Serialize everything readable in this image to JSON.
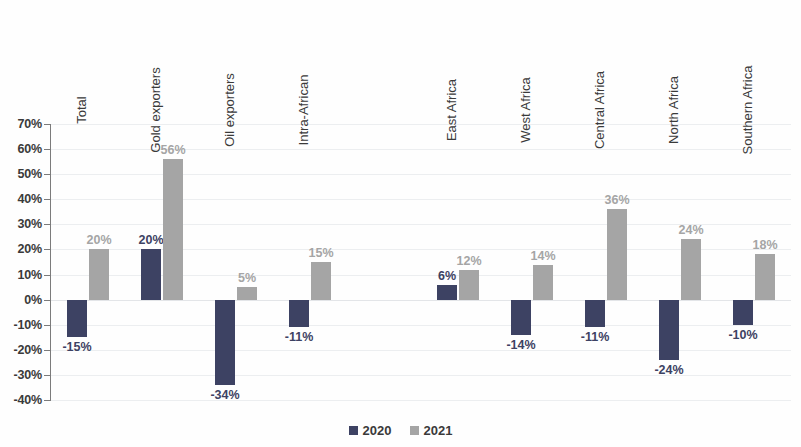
{
  "chart_data": {
    "type": "bar",
    "title": "",
    "subtitle": "",
    "xlabel": "",
    "ylabel": "",
    "ylim": [
      -40,
      70
    ],
    "ytick_labels": [
      "70%",
      "60%",
      "50%",
      "40%",
      "30%",
      "20%",
      "10%",
      "0%",
      "-10%",
      "-20%",
      "-30%",
      "-40%"
    ],
    "ytick_values": [
      70,
      60,
      50,
      40,
      30,
      20,
      10,
      0,
      -10,
      -20,
      -30,
      -40
    ],
    "grid": true,
    "legend_position": "bottom-center",
    "categories": [
      "Total",
      "Gold exporters",
      "Oil exporters",
      "Intra-African",
      "",
      "East Africa",
      "West Africa",
      "Central Africa",
      "North Africa",
      "Southern Africa"
    ],
    "series": [
      {
        "name": "2020",
        "color": "#3d4263",
        "values": [
          -15,
          20,
          -34,
          -11,
          null,
          6,
          -14,
          -11,
          -24,
          -10
        ],
        "labels": [
          "-15%",
          "20%",
          "-34%",
          "-11%",
          "",
          "6%",
          "-14%",
          "-11%",
          "-24%",
          "-10%"
        ]
      },
      {
        "name": "2021",
        "color": "#a5a5a5",
        "values": [
          20,
          56,
          5,
          15,
          null,
          12,
          14,
          36,
          24,
          18
        ],
        "labels": [
          "20%",
          "56%",
          "5%",
          "15%",
          "",
          "12%",
          "14%",
          "36%",
          "24%",
          "18%"
        ]
      }
    ]
  },
  "legend": {
    "items": [
      {
        "label": "2020",
        "color": "#3d4263"
      },
      {
        "label": "2021",
        "color": "#a5a5a5"
      }
    ]
  }
}
